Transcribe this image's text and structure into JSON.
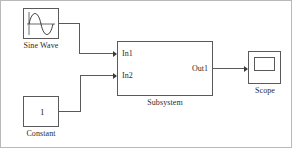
{
  "diagram": {
    "background_color": "#ffffff",
    "line_color": "#5a5a5a",
    "text_color": "#2b2b2b",
    "blocks": [
      {
        "id": "sine-wave",
        "label": "Sine Wave",
        "icon": "sine-wave-icon",
        "x": 22,
        "y": 7,
        "w": 36,
        "h": 31
      },
      {
        "id": "constant",
        "label": "Constant",
        "value": "1",
        "x": 22,
        "y": 95,
        "w": 36,
        "h": 31
      },
      {
        "id": "subsystem",
        "label": "Subsystem",
        "x": 116,
        "y": 40,
        "w": 96,
        "h": 55,
        "inputs": [
          "In1",
          "In2"
        ],
        "outputs": [
          "Out1"
        ]
      },
      {
        "id": "scope",
        "label": "Scope",
        "icon": "scope-icon",
        "x": 247,
        "y": 50,
        "w": 33,
        "h": 33
      }
    ],
    "signals": [
      {
        "id": "sine-to-in1",
        "from": "sine-wave",
        "to": "In1"
      },
      {
        "id": "constant-to-in2",
        "from": "constant",
        "to": "In2"
      },
      {
        "id": "out1-to-scope",
        "from": "Out1",
        "to": "scope"
      }
    ]
  }
}
